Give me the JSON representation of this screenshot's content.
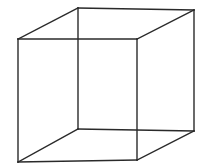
{
  "diagram": {
    "type": "wireframe-cube",
    "stroke_color": "#2a2a2a",
    "stroke_width": 1.4,
    "background": "#ffffff",
    "vertices": {
      "front_top_left": [
        18,
        39
      ],
      "front_top_right": [
        137,
        39
      ],
      "front_bottom_right": [
        137,
        160
      ],
      "front_bottom_left": [
        18,
        162
      ],
      "back_top_left": [
        78,
        8
      ],
      "back_top_right": [
        194,
        10
      ],
      "back_bottom_right": [
        194,
        131
      ],
      "back_bottom_left": [
        78,
        129
      ]
    },
    "edges": [
      [
        "front_top_left",
        "front_top_right"
      ],
      [
        "front_top_right",
        "front_bottom_right"
      ],
      [
        "front_bottom_right",
        "front_bottom_left"
      ],
      [
        "front_bottom_left",
        "front_top_left"
      ],
      [
        "back_top_left",
        "back_top_right"
      ],
      [
        "back_top_right",
        "back_bottom_right"
      ],
      [
        "back_bottom_right",
        "back_bottom_left"
      ],
      [
        "back_bottom_left",
        "back_top_left"
      ],
      [
        "front_top_left",
        "back_top_left"
      ],
      [
        "front_top_right",
        "back_top_right"
      ],
      [
        "front_bottom_right",
        "back_bottom_right"
      ],
      [
        "front_bottom_left",
        "back_bottom_left"
      ]
    ]
  }
}
